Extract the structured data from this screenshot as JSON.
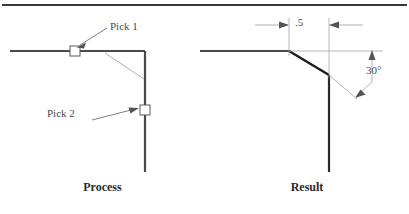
{
  "figure": {
    "width": 409,
    "height": 214,
    "background": "#ffffff",
    "top_rule_color": "#3a3a3a",
    "object_line_color": "#4a4a4a",
    "thin_line_color": "#8c8c8c",
    "chamfer_line_color": "#1c1c1c",
    "text_color": "#4a4a4a",
    "caption_color": "#2b2b2b"
  },
  "panels": {
    "process": {
      "caption": "Process",
      "annotations": [
        {
          "id": "pick1",
          "label": "Pick 1"
        },
        {
          "id": "pick2",
          "label": "Pick 2"
        }
      ],
      "markers": [
        {
          "id": "pick1-marker",
          "shape": "square"
        },
        {
          "id": "pick2-marker",
          "shape": "square"
        }
      ]
    },
    "result": {
      "caption": "Result",
      "dimensions": [
        {
          "id": "offset",
          "label": ".5",
          "type": "linear"
        },
        {
          "id": "angle",
          "label": "30°",
          "type": "angular"
        }
      ]
    }
  }
}
